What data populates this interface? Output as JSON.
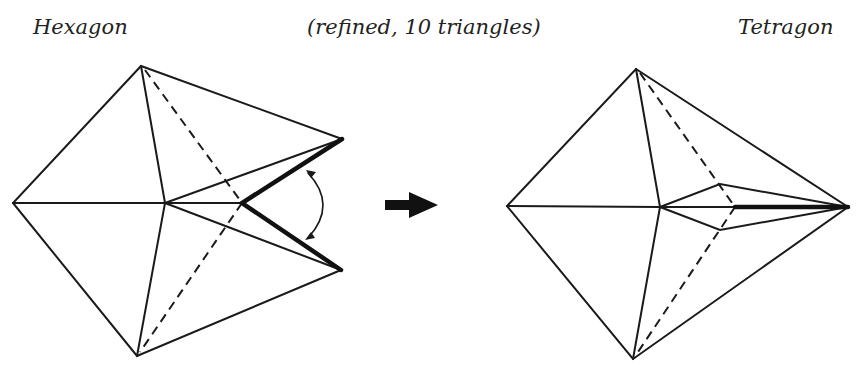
{
  "labels": {
    "left": "Hexagon",
    "middle": "(refined, 10 triangles)",
    "right": "Tetragon"
  },
  "figures": {
    "left": {
      "name": "hexagon-fan",
      "vertices": {
        "top": [
          141,
          66
        ],
        "left": [
          13,
          203
        ],
        "center": [
          165,
          203
        ],
        "bottom": [
          137,
          356
        ],
        "right_upper": [
          342,
          139
        ],
        "right_lower": [
          341,
          270
        ],
        "fold_point": [
          242,
          203
        ]
      }
    },
    "right": {
      "name": "tetragon-fan",
      "vertices": {
        "top": [
          636,
          69
        ],
        "left": [
          507,
          206
        ],
        "center": [
          660,
          207
        ],
        "bottom": [
          633,
          359
        ],
        "tip": [
          848,
          207
        ],
        "inner_upper": [
          720,
          184
        ],
        "inner_lower": [
          720,
          230
        ],
        "inner_mid": [
          735,
          207
        ]
      }
    }
  },
  "transition_arrow": "right-arrow",
  "colors": {
    "line": "#1a1a1a",
    "text": "#222222",
    "background": "#ffffff"
  }
}
